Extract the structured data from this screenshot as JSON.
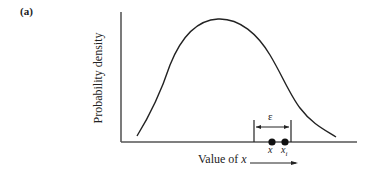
{
  "figure": {
    "panel_label": "(a)",
    "y_axis_label": "Probability density",
    "x_axis_label_prefix": "Value of ",
    "x_axis_label_var": "x",
    "epsilon_label": "ε",
    "point_x_label": "x",
    "point_xi_label": "x",
    "point_xi_subscript": "i",
    "line_color": "#222222"
  }
}
